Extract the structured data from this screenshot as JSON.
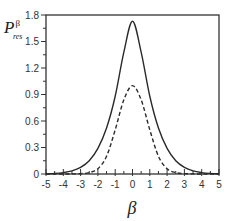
{
  "chart_data": {
    "type": "line",
    "title": "",
    "xlabel": "β",
    "ylabel": {
      "main": "P",
      "subscript": "res",
      "superscript": "β"
    },
    "xlim": [
      -5,
      5
    ],
    "ylim": [
      0,
      1.8
    ],
    "xticks": [
      -5,
      -4,
      -3,
      -2,
      -1,
      0,
      1,
      2,
      3,
      4,
      5
    ],
    "xtick_labels": [
      "-5",
      "-4",
      "-3",
      "-2",
      "-1",
      "0",
      "1",
      "2",
      "3",
      "4",
      "5"
    ],
    "yticks": [
      0,
      0.3,
      0.6,
      0.9,
      1.2,
      1.5,
      1.8
    ],
    "ytick_labels": [
      "0",
      "0.3",
      "0.6",
      "0.9",
      "1.2",
      "1.5",
      "1.8"
    ],
    "grid": false,
    "legend": null,
    "x": [
      -5,
      -4.5,
      -4,
      -3.5,
      -3,
      -2.5,
      -2,
      -1.5,
      -1,
      -0.5,
      0,
      0.5,
      1,
      1.5,
      2,
      2.5,
      3,
      3.5,
      4,
      4.5,
      5
    ],
    "series": [
      {
        "name": "solid",
        "style": "solid",
        "peak": 1.73,
        "values": [
          0.003,
          0.007,
          0.016,
          0.035,
          0.075,
          0.15,
          0.29,
          0.52,
          0.88,
          1.38,
          1.73,
          1.38,
          0.88,
          0.52,
          0.29,
          0.15,
          0.075,
          0.035,
          0.016,
          0.007,
          0.003
        ]
      },
      {
        "name": "dashed",
        "style": "dashed",
        "peak": 1.0,
        "values": [
          0.0,
          0.0,
          0.0,
          0.001,
          0.004,
          0.016,
          0.06,
          0.2,
          0.5,
          0.84,
          1.0,
          0.84,
          0.5,
          0.2,
          0.06,
          0.016,
          0.004,
          0.001,
          0.0,
          0.0,
          0.0
        ]
      }
    ]
  }
}
